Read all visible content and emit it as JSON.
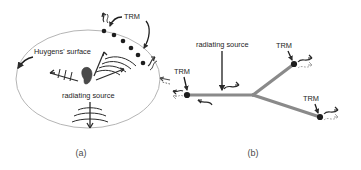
{
  "figure": {
    "background_color": "#ffffff",
    "ink_color": "#2b2b2b",
    "line_color": "#8a8a8a",
    "ellipse_color": "#b0b0b0"
  },
  "panel_a": {
    "caption": "(a)",
    "labels": {
      "huygens_surface": "Huygens' surface",
      "radiating_source": "radiating source",
      "trm": "TRM"
    },
    "trm_array": {
      "count": 6,
      "description": "curved chain of transducer dots along upper-right of Huygens' surface"
    },
    "wave_arrows": [
      {
        "name": "wave-arrow-up-right",
        "direction": "up-right"
      },
      {
        "name": "wave-arrow-left",
        "direction": "left"
      },
      {
        "name": "wave-arrow-down",
        "direction": "down"
      },
      {
        "name": "wave-arrow-right-outer",
        "direction": "right"
      }
    ]
  },
  "panel_b": {
    "caption": "(b)",
    "labels": {
      "radiating_source": "radiating source",
      "trm_left": "TRM",
      "trm_upper_right": "TRM",
      "trm_lower_right": "TRM"
    },
    "nodes": {
      "count": 3,
      "description": "three TRM transducer nodes on a branching waveguide network"
    },
    "wave_arrows": [
      {
        "name": "wave-arrow-outgoing-left",
        "direction": "left"
      },
      {
        "name": "wave-arrow-return-left",
        "direction": "left"
      },
      {
        "name": "wave-arrow-outgoing-right",
        "direction": "right"
      },
      {
        "name": "wave-arrow-upper-branch",
        "direction": "right"
      },
      {
        "name": "wave-arrow-lower-branch",
        "direction": "right"
      }
    ]
  }
}
